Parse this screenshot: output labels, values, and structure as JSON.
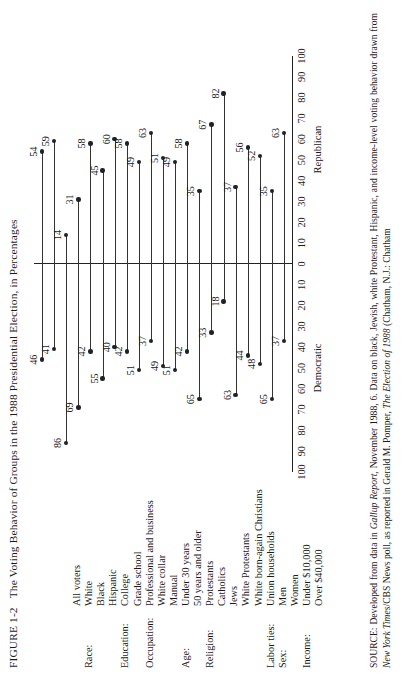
{
  "figure": {
    "label": "FIGURE 1-2",
    "title": "The Voting Behavior of Groups in the 1988 Presidential Election, in Percentages"
  },
  "axis": {
    "ticks_left": [
      "100",
      "90",
      "80",
      "70",
      "60",
      "50",
      "40",
      "30",
      "20",
      "10"
    ],
    "ticks_right": [
      "0",
      "10",
      "20",
      "30",
      "40",
      "50",
      "60",
      "70",
      "80",
      "90",
      "100"
    ],
    "left_name": "Democratic",
    "right_name": "Republican"
  },
  "source": {
    "prefix": "SOURCE:",
    "text_1": " Developed from data in ",
    "italic_1": "Gallup Report,",
    "text_2": " November 1988, 6. Data on black, Jewish, white Protestant, Hispanic, and income-level voting behavior drawn from ",
    "italic_2": "New York Times",
    "text_3": "/CBS News poll, as reported in Gerald M. Pomper, ",
    "italic_3": "The Election of 1988",
    "text_4": " (Chatham, N.J.: Chatham"
  },
  "chart_data": {
    "type": "bar",
    "title": "The Voting Behavior of Groups in the 1988 Presidential Election, in Percentages",
    "xlabel": "Percentage",
    "ylabel": "",
    "xlim": [
      -100,
      100
    ],
    "grid": false,
    "legend": [
      "Democratic",
      "Republican"
    ],
    "series": [
      {
        "name": "Democratic",
        "values": [
          46,
          41,
          86,
          69,
          42,
          55,
          40,
          42,
          51,
          37,
          49,
          51,
          42,
          49,
          65,
          33,
          18,
          63,
          44,
          48,
          65,
          37
        ]
      },
      {
        "name": "Republican",
        "values": [
          54,
          59,
          14,
          31,
          58,
          45,
          60,
          58,
          49,
          63,
          51,
          49,
          58,
          35,
          35,
          67,
          82,
          37,
          56,
          52,
          35,
          63
        ]
      }
    ],
    "groups": [
      {
        "category": "",
        "rows": [
          {
            "label": "All voters",
            "democratic": 46,
            "republican": 54
          }
        ]
      },
      {
        "category": "Race:",
        "rows": [
          {
            "label": "White",
            "democratic": 41,
            "republican": 59
          },
          {
            "label": "Black",
            "democratic": 86,
            "republican": 14
          },
          {
            "label": "Hispanic",
            "democratic": 69,
            "republican": 31
          }
        ]
      },
      {
        "category": "Education:",
        "rows": [
          {
            "label": "College",
            "democratic": 42,
            "republican": 58
          },
          {
            "label": "Grade school",
            "democratic": 55,
            "republican": 45
          }
        ]
      },
      {
        "category": "Occupation:",
        "rows": [
          {
            "label": "Professional and business",
            "democratic": 40,
            "republican": 60
          },
          {
            "label": "White collar",
            "democratic": 42,
            "republican": 58
          },
          {
            "label": "Manual",
            "democratic": 51,
            "republican": 49
          }
        ]
      },
      {
        "category": "Age:",
        "rows": [
          {
            "label": "Under 30 years",
            "democratic": 37,
            "republican": 63
          },
          {
            "label": "50 years and older",
            "democratic": 49,
            "republican": 51
          }
        ]
      },
      {
        "category": "Religion:",
        "rows": [
          {
            "label": "Protestants",
            "democratic": 51,
            "republican": 49
          },
          {
            "label": "Catholics",
            "democratic": 42,
            "republican": 58
          },
          {
            "label": "Jews",
            "democratic": 49,
            "republican": 35
          },
          {
            "label": "White Protestants",
            "democratic": 65,
            "republican": 35
          },
          {
            "label": "White born-again Christians",
            "democratic": 33,
            "republican": 67
          },
          {
            "label": "",
            "democratic": 18,
            "republican": 82
          }
        ]
      },
      {
        "category": "Labor ties:",
        "rows": [
          {
            "label": "Union households",
            "democratic": 63,
            "republican": 37
          }
        ]
      },
      {
        "category": "Sex:",
        "rows": [
          {
            "label": "Men",
            "democratic": 44,
            "republican": 56
          },
          {
            "label": "Women",
            "democratic": 48,
            "republican": 52
          }
        ]
      },
      {
        "category": "Income:",
        "rows": [
          {
            "label": "Under $10,000",
            "democratic": 65,
            "republican": 35
          },
          {
            "label": "Over $40,000",
            "democratic": 37,
            "republican": 63
          }
        ]
      }
    ],
    "rows_flat": [
      {
        "category": "",
        "label": "All voters",
        "democratic": 46,
        "republican": 54
      },
      {
        "category": "Race:",
        "label": "White",
        "democratic": 41,
        "republican": 59
      },
      {
        "category": "",
        "label": "Black",
        "democratic": 86,
        "republican": 14
      },
      {
        "category": "",
        "label": "Hispanic",
        "democratic": 69,
        "republican": 31
      },
      {
        "category": "Education:",
        "label": "College",
        "democratic": 42,
        "republican": 58
      },
      {
        "category": "",
        "label": "Grade school",
        "democratic": 55,
        "republican": 45
      },
      {
        "category": "Occupation:",
        "label": "Professional and business",
        "democratic": 40,
        "republican": 60
      },
      {
        "category": "",
        "label": "White collar",
        "democratic": 42,
        "republican": 58
      },
      {
        "category": "",
        "label": "Manual",
        "democratic": 51,
        "republican": 49
      },
      {
        "category": "Age:",
        "label": "Under 30 years",
        "democratic": 37,
        "republican": 63
      },
      {
        "category": "",
        "label": "50 years and older",
        "democratic": 49,
        "republican": 51
      },
      {
        "category": "Religion:",
        "label": "Protestants",
        "democratic": 51,
        "republican": 49
      },
      {
        "category": "",
        "label": "Catholics",
        "democratic": 42,
        "republican": 58
      },
      {
        "category": "",
        "label": "Jews",
        "democratic": 65,
        "republican": 35
      },
      {
        "category": "",
        "label": "White Protestants",
        "democratic": 33,
        "republican": 67
      },
      {
        "category": "",
        "label": "White born-again Christians",
        "democratic": 18,
        "republican": 82
      },
      {
        "category": "Labor ties:",
        "label": "Union households",
        "democratic": 63,
        "republican": 37
      },
      {
        "category": "Sex:",
        "label": "Men",
        "democratic": 44,
        "republican": 56
      },
      {
        "category": "",
        "label": "Women",
        "democratic": 48,
        "republican": 52
      },
      {
        "category": "Income:",
        "label": "Under $10,000",
        "democratic": 65,
        "republican": 35
      },
      {
        "category": "",
        "label": "Over $40,000",
        "democratic": 37,
        "republican": 63
      }
    ]
  }
}
